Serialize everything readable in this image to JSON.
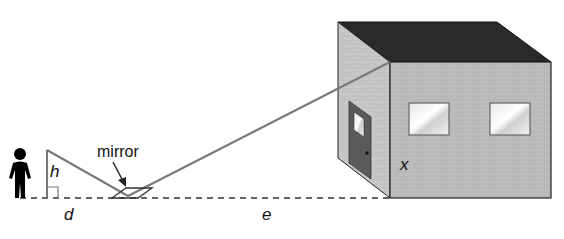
{
  "diagram": {
    "type": "indirect-measurement-mirror",
    "labels": {
      "mirror": "mirror",
      "h": "h",
      "d": "d",
      "e": "e",
      "x": "x"
    },
    "colors": {
      "ray": "#7a7a7a",
      "roof": "#2b2b2b",
      "wall_front": "#b9b9b9",
      "wall_side": "#c6c6c6",
      "door": "#5a5a5a",
      "window": "#eeeeee",
      "person": "#000000",
      "ground": "#333333"
    }
  }
}
